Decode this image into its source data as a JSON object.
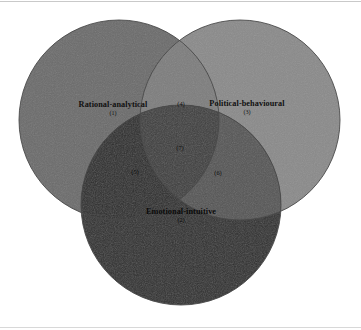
{
  "figure": {
    "type": "venn-diagram",
    "set_count": 3,
    "background_color": "#ffffff",
    "outline_color": "#4a4a4a"
  },
  "sets": [
    {
      "key": "rational",
      "title": "Rational-analytical",
      "number": "(1)",
      "color": "#6b6b6b",
      "position": "left",
      "cx": 119,
      "cy": 120,
      "r": 100,
      "label_x": 113,
      "label_y": 108
    },
    {
      "key": "political",
      "title": "Political-behavioural",
      "number": "(3)",
      "color": "#8a8a8a",
      "position": "right",
      "cx": 240,
      "cy": 120,
      "r": 100,
      "label_x": 247,
      "label_y": 107
    },
    {
      "key": "emotional",
      "title": "Emotional-intuitive",
      "number": "(2)",
      "color": "#2e2e2e",
      "position": "bottom",
      "cx": 181,
      "cy": 205,
      "r": 100,
      "label_x": 181,
      "label_y": 215
    }
  ],
  "regions": [
    {
      "key": "rational-political",
      "number": "(4)",
      "color": "#7d7d7d",
      "x": 181,
      "y": 103,
      "ink": "ink-dark"
    },
    {
      "key": "rational-political-emotional",
      "number": "(7)",
      "color": "#3e3e3e",
      "x": 180,
      "y": 147,
      "ink": "ink-light"
    },
    {
      "key": "rational-emotional",
      "number": "(5)",
      "color": "#2b2b2b",
      "x": 135,
      "y": 171,
      "ink": "ink-onblack"
    },
    {
      "key": "political-emotional",
      "number": "(6)",
      "color": "#555555",
      "x": 218,
      "y": 172,
      "ink": "ink-light"
    }
  ]
}
